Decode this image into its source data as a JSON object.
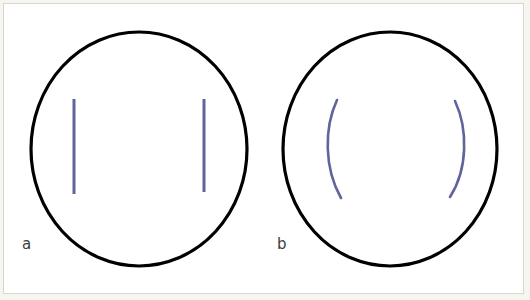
{
  "figure": {
    "background_color": "#ffffff",
    "page_tint_color": "#f7f5ef",
    "frame_border_color": "#d9d7d0",
    "outline_color": "#000000",
    "stimulus_color": "#5f649b",
    "label_color": "#3c3c3c",
    "width": 530,
    "height": 300
  },
  "panels": [
    {
      "id": "a",
      "label": "a",
      "circle": {
        "cx": 139,
        "cy": 149,
        "rx": 108,
        "ry": 117,
        "stroke_width": 3.2
      },
      "stimulus_type": "straight-vertical-lines",
      "elements": [
        {
          "name": "left-straight-line",
          "x": 74,
          "y1": 99,
          "y2": 194,
          "stroke_width": 3
        },
        {
          "name": "right-straight-line",
          "x": 204,
          "y1": 99,
          "y2": 192,
          "stroke_width": 3
        }
      ]
    },
    {
      "id": "b",
      "label": "b",
      "circle": {
        "cx": 390,
        "cy": 149,
        "rx": 107,
        "ry": 117,
        "stroke_width": 3.2
      },
      "stimulus_type": "curved-arcs",
      "elements": [
        {
          "name": "left-arc",
          "path": "M 337,100 C 324,128 324,168 341,198",
          "stroke_width": 2.6
        },
        {
          "name": "right-arc",
          "path": "M 455,101 C 468,129 468,169 450,197",
          "stroke_width": 2.6
        }
      ]
    }
  ]
}
